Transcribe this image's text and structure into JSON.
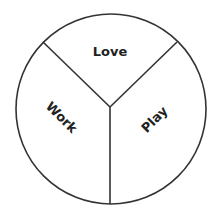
{
  "diagram": {
    "type": "three-part circle diagram",
    "stroke_color": "#333333",
    "text_color": "#222222",
    "background": "#ffffff",
    "sections": [
      {
        "id": "love",
        "label": "Love",
        "position": "top"
      },
      {
        "id": "work",
        "label": "Work",
        "position": "bottom-left"
      },
      {
        "id": "play",
        "label": "Play",
        "position": "bottom-right"
      }
    ]
  }
}
